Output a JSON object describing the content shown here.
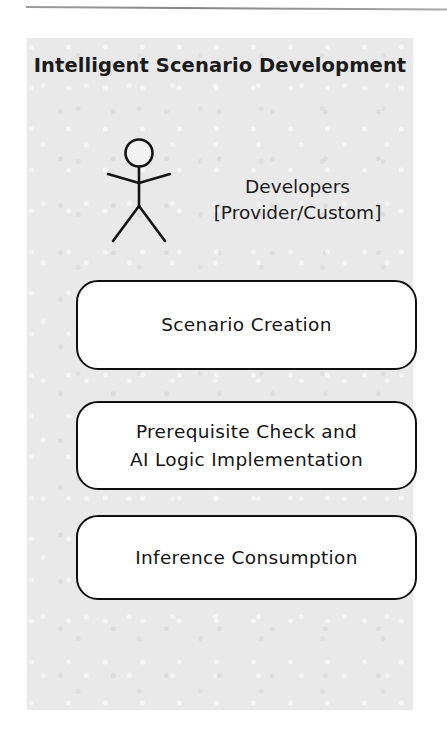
{
  "diagram": {
    "type": "uml-use-case",
    "package": {
      "title": "Intelligent Scenario Development",
      "background_color": "#e9e9e9"
    },
    "actor": {
      "icon": "stick-figure-actor-icon",
      "label_lines": [
        "Developers",
        "[Provider/Custom]"
      ]
    },
    "use_cases": [
      {
        "id": "scenario-creation",
        "label_lines": [
          "Scenario Creation"
        ]
      },
      {
        "id": "prerequisite-check-ai-logic",
        "label_lines": [
          "Prerequisite Check and",
          "AI Logic Implementation"
        ]
      },
      {
        "id": "inference-consumption",
        "label_lines": [
          "Inference Consumption"
        ]
      }
    ],
    "colors": {
      "box_fill": "#ffffff",
      "box_stroke": "#111111",
      "text": "#141414",
      "rule": "#6f6f6f"
    }
  }
}
